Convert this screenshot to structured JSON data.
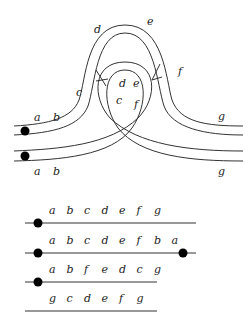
{
  "figure": {
    "top_diagram": {
      "description": "Two parallel ribbons with a loop passing through an arch; labels along strands",
      "labels": [
        {
          "text": "d",
          "x": 94,
          "y": 33
        },
        {
          "text": "e",
          "x": 147,
          "y": 25
        },
        {
          "text": "f",
          "x": 178,
          "y": 75
        },
        {
          "text": "c",
          "x": 76,
          "y": 96
        },
        {
          "text": "d",
          "x": 119,
          "y": 87
        },
        {
          "text": "e",
          "x": 133,
          "y": 87
        },
        {
          "text": "c",
          "x": 116,
          "y": 104
        },
        {
          "text": "f",
          "x": 134,
          "y": 108
        },
        {
          "text": "a",
          "x": 34,
          "y": 121
        },
        {
          "text": "b",
          "x": 53,
          "y": 121
        },
        {
          "text": "g",
          "x": 218,
          "y": 120
        },
        {
          "text": "a",
          "x": 34,
          "y": 175
        },
        {
          "text": "b",
          "x": 53,
          "y": 175
        },
        {
          "text": "g",
          "x": 218,
          "y": 175
        }
      ],
      "dots": [
        {
          "x": 25,
          "y": 131
        },
        {
          "x": 25,
          "y": 156
        }
      ]
    },
    "sequences": [
      {
        "labels": [
          "a",
          "b",
          "c",
          "d",
          "e",
          "f",
          "g"
        ],
        "left_dot": true,
        "right_dot": false,
        "line_end": 196
      },
      {
        "labels": [
          "a",
          "b",
          "c",
          "d",
          "e",
          "f",
          "b",
          "a"
        ],
        "left_dot": true,
        "right_dot": true,
        "line_end": 196
      },
      {
        "labels": [
          "a",
          "b",
          "f",
          "e",
          "d",
          "c",
          "g"
        ],
        "left_dot": true,
        "right_dot": false,
        "line_end": 157
      },
      {
        "labels": [
          "g",
          "c",
          "d",
          "e",
          "f",
          "g"
        ],
        "left_dot": false,
        "right_dot": false,
        "line_end": 157
      }
    ]
  }
}
